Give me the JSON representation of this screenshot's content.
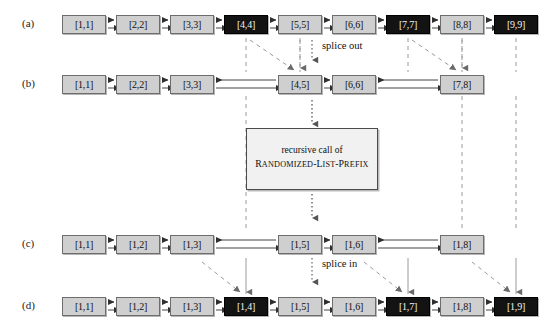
{
  "figure": {
    "row_labels": [
      "(a)",
      "(b)",
      "(c)",
      "(d)"
    ],
    "annotations": {
      "splice_out": "splice out",
      "splice_in": "splice in",
      "recursive_line1": "recursive call of",
      "recursive_line2_first": "R",
      "recursive_line2_rest": "ANDOMIZED",
      "recursive_dash1": "-L",
      "recursive_rest1": "IST",
      "recursive_dash2": "-P",
      "recursive_rest2": "REFIX"
    },
    "colors": {
      "node_light": "#cfcfcf",
      "node_dark": "#131313",
      "node_border": "#6d6d6d",
      "line": "#3a3a3a",
      "dashed": "#8a8a8a",
      "box_fill": "#f1f1f1"
    },
    "rows": [
      {
        "id": "a",
        "label": "(a)",
        "nodes": [
          {
            "label": "[1,1]",
            "dark": false,
            "x": 62
          },
          {
            "label": "[2,2]",
            "dark": false,
            "x": 116
          },
          {
            "label": "[3,3]",
            "dark": false,
            "x": 170
          },
          {
            "label": "[4,4]",
            "dark": true,
            "x": 224
          },
          {
            "label": "[5,5]",
            "dark": false,
            "x": 278
          },
          {
            "label": "[6,6]",
            "dark": false,
            "x": 332
          },
          {
            "label": "[7,7]",
            "dark": true,
            "x": 386
          },
          {
            "label": "[8,8]",
            "dark": false,
            "x": 440
          },
          {
            "label": "[9,9]",
            "dark": true,
            "x": 494
          }
        ]
      },
      {
        "id": "b",
        "label": "(b)",
        "nodes": [
          {
            "label": "[1,1]",
            "dark": false,
            "x": 62
          },
          {
            "label": "[2,2]",
            "dark": false,
            "x": 116
          },
          {
            "label": "[3,3]",
            "dark": false,
            "x": 170
          },
          {
            "label": "[4,5]",
            "dark": false,
            "x": 278
          },
          {
            "label": "[6,6]",
            "dark": false,
            "x": 332
          },
          {
            "label": "[7,8]",
            "dark": false,
            "x": 440
          }
        ]
      },
      {
        "id": "c",
        "label": "(c)",
        "nodes": [
          {
            "label": "[1,1]",
            "dark": false,
            "x": 62
          },
          {
            "label": "[1,2]",
            "dark": false,
            "x": 116
          },
          {
            "label": "[1,3]",
            "dark": false,
            "x": 170
          },
          {
            "label": "[1,5]",
            "dark": false,
            "x": 278
          },
          {
            "label": "[1,6]",
            "dark": false,
            "x": 332
          },
          {
            "label": "[1,8]",
            "dark": false,
            "x": 440
          }
        ]
      },
      {
        "id": "d",
        "label": "(d)",
        "nodes": [
          {
            "label": "[1,1]",
            "dark": false,
            "x": 62
          },
          {
            "label": "[1,2]",
            "dark": false,
            "x": 116
          },
          {
            "label": "[1,3]",
            "dark": false,
            "x": 170
          },
          {
            "label": "[1,4]",
            "dark": true,
            "x": 224
          },
          {
            "label": "[1,5]",
            "dark": false,
            "x": 278
          },
          {
            "label": "[1,6]",
            "dark": false,
            "x": 332
          },
          {
            "label": "[1,7]",
            "dark": true,
            "x": 386
          },
          {
            "label": "[1,8]",
            "dark": false,
            "x": 440
          },
          {
            "label": "[1,9]",
            "dark": true,
            "x": 494
          }
        ]
      }
    ]
  }
}
